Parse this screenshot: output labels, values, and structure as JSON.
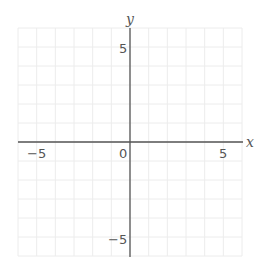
{
  "chart_data": {
    "type": "line",
    "title": "",
    "xlabel": "x",
    "ylabel": "y",
    "xlim": [
      -6,
      6
    ],
    "ylim": [
      -6,
      6
    ],
    "grid": true,
    "grid_step": 1,
    "x_ticks": [
      -5,
      0,
      5
    ],
    "y_ticks": [
      5,
      -5
    ],
    "x_tick_labels": [
      "−5",
      "0",
      "5"
    ],
    "y_tick_labels": [
      "5",
      "−5"
    ],
    "series": []
  },
  "labels": {
    "x_axis": "x",
    "y_axis": "y",
    "origin": "0",
    "x_neg5": "−5",
    "x_pos5": "5",
    "y_pos5": "5",
    "y_neg5": "−5"
  },
  "colors": {
    "grid": "#ececec",
    "axis": "#666666",
    "text": "#555555"
  }
}
